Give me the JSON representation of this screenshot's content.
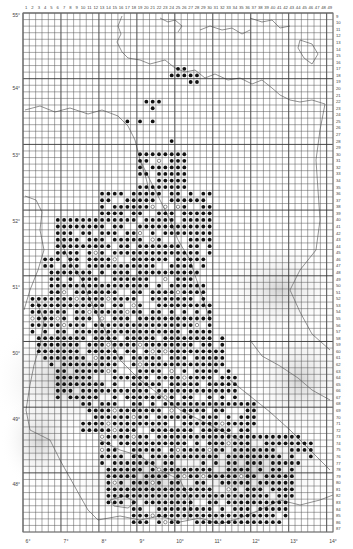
{
  "map": {
    "type": "grid distribution map",
    "grid": {
      "left": 23,
      "top": 13,
      "right": 333,
      "bottom": 532,
      "col_first": 1,
      "col_last": 49,
      "row_first": 9,
      "row_last": 87
    },
    "column_labels": [
      "1",
      "2",
      "3",
      "4",
      "5",
      "6",
      "7",
      "8",
      "9",
      "10",
      "11",
      "12",
      "13",
      "14",
      "15",
      "16",
      "17",
      "18",
      "19",
      "20",
      "21",
      "22",
      "23",
      "24",
      "25",
      "26",
      "27",
      "28",
      "29",
      "30",
      "31",
      "32",
      "33",
      "34",
      "35",
      "36",
      "37",
      "38",
      "39",
      "40",
      "41",
      "42",
      "43",
      "44",
      "45",
      "46",
      "47",
      "48",
      "49"
    ],
    "row_labels": [
      "9",
      "10",
      "11",
      "12",
      "13",
      "14",
      "15",
      "16",
      "17",
      "18",
      "19",
      "20",
      "21",
      "22",
      "23",
      "24",
      "25",
      "26",
      "27",
      "28",
      "29",
      "30",
      "31",
      "32",
      "33",
      "34",
      "35",
      "36",
      "37",
      "38",
      "39",
      "40",
      "41",
      "42",
      "43",
      "44",
      "45",
      "46",
      "47",
      "48",
      "49",
      "50",
      "51",
      "52",
      "53",
      "54",
      "55",
      "56",
      "57",
      "58",
      "59",
      "60",
      "61",
      "62",
      "63",
      "64",
      "65",
      "66",
      "67",
      "68",
      "69",
      "70",
      "71",
      "72",
      "73",
      "74",
      "75",
      "76",
      "77",
      "78",
      "79",
      "80",
      "81",
      "82",
      "83",
      "84",
      "85",
      "86",
      "87"
    ],
    "longitude_labels": [
      {
        "text": "6°",
        "x": 28
      },
      {
        "text": "7°",
        "x": 66
      },
      {
        "text": "8°",
        "x": 104
      },
      {
        "text": "9°",
        "x": 142
      },
      {
        "text": "10°",
        "x": 180
      },
      {
        "text": "11°",
        "x": 218
      },
      {
        "text": "12°",
        "x": 256
      },
      {
        "text": "13°",
        "x": 294
      },
      {
        "text": "14°",
        "x": 333
      }
    ],
    "latitude_labels": [
      {
        "text": "55°",
        "y": 15
      },
      {
        "text": "54°",
        "y": 88
      },
      {
        "text": "53°",
        "y": 155
      },
      {
        "text": "52°",
        "y": 221
      },
      {
        "text": "51°",
        "y": 287
      },
      {
        "text": "50°",
        "y": 353
      },
      {
        "text": "49°",
        "y": 419
      },
      {
        "text": "48°",
        "y": 484
      }
    ],
    "colors": {
      "grid": "#555555",
      "grid_thick": "#333333",
      "border": "#777777",
      "relief": "#d8d8d8",
      "dot": "#111111",
      "open_dot": "#444444"
    },
    "legend": {
      "filled_dot": "record present",
      "open_dot": "older / uncertain record"
    }
  }
}
